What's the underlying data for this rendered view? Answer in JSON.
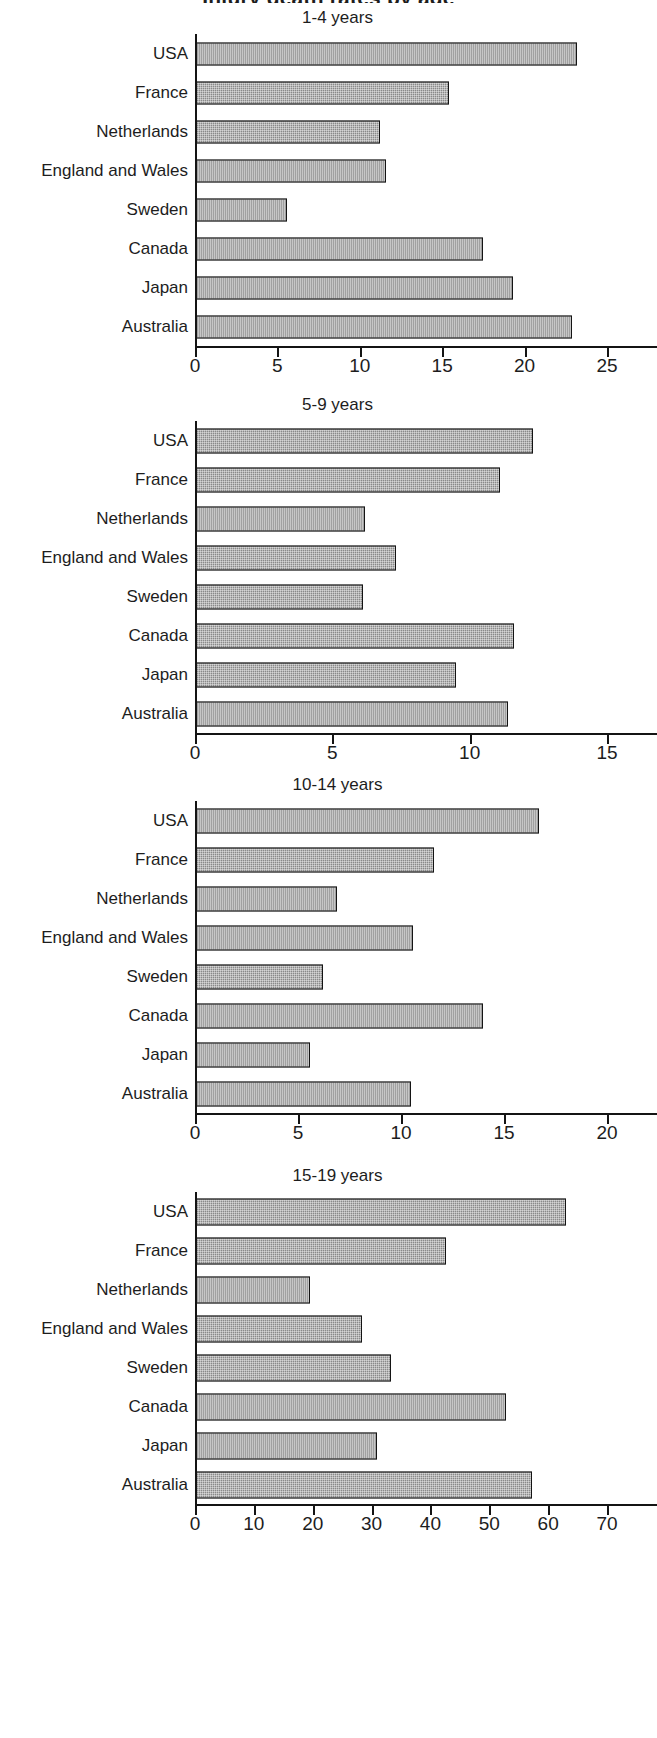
{
  "figure": {
    "main_title": "Injury death rates by age",
    "categories": [
      "USA",
      "France",
      "Netherlands",
      "England and Wales",
      "Sweden",
      "Canada",
      "Japan",
      "Australia"
    ]
  },
  "chart_data": [
    {
      "type": "bar",
      "orientation": "horizontal",
      "title": "1-4 years",
      "xlabel": "",
      "ylabel": "",
      "categories": [
        "USA",
        "France",
        "Netherlands",
        "England and Wales",
        "Sweden",
        "Canada",
        "Japan",
        "Australia"
      ],
      "values": [
        23.2,
        15.4,
        11.2,
        11.6,
        5.6,
        17.5,
        19.3,
        22.9
      ],
      "xlim": [
        0,
        25
      ],
      "ticks": [
        0,
        5,
        10,
        15,
        20,
        25
      ],
      "tick_labels": [
        "0",
        "5",
        "10",
        "15",
        "20",
        "25"
      ],
      "grid": false,
      "legend": "none"
    },
    {
      "type": "bar",
      "orientation": "horizontal",
      "title": "5-9 years",
      "xlabel": "",
      "ylabel": "",
      "categories": [
        "USA",
        "France",
        "Netherlands",
        "England and Wales",
        "Sweden",
        "Canada",
        "Japan",
        "Australia"
      ],
      "values": [
        12.3,
        11.1,
        6.2,
        7.3,
        6.1,
        11.6,
        9.5,
        11.4
      ],
      "xlim": [
        0,
        15
      ],
      "ticks": [
        0,
        5,
        10,
        15
      ],
      "tick_labels": [
        "0",
        "5",
        "10",
        "15"
      ],
      "grid": false,
      "legend": "none"
    },
    {
      "type": "bar",
      "orientation": "horizontal",
      "title": "10-14 years",
      "xlabel": "",
      "ylabel": "",
      "categories": [
        "USA",
        "France",
        "Netherlands",
        "England and Wales",
        "Sweden",
        "Canada",
        "Japan",
        "Australia"
      ],
      "values": [
        16.7,
        11.6,
        6.9,
        10.6,
        6.2,
        14.0,
        5.6,
        10.5
      ],
      "xlim": [
        0,
        20
      ],
      "ticks": [
        0,
        5,
        10,
        15,
        20
      ],
      "tick_labels": [
        "0",
        "5",
        "10",
        "15",
        "20"
      ],
      "grid": false,
      "legend": "none"
    },
    {
      "type": "bar",
      "orientation": "horizontal",
      "title": "15-19 years",
      "xlabel": "",
      "ylabel": "",
      "categories": [
        "USA",
        "France",
        "Netherlands",
        "England and Wales",
        "Sweden",
        "Canada",
        "Japan",
        "Australia"
      ],
      "values": [
        63.0,
        42.6,
        19.6,
        28.3,
        33.3,
        52.9,
        31.0,
        57.2
      ],
      "xlim": [
        0,
        70
      ],
      "ticks": [
        0,
        10,
        20,
        30,
        40,
        50,
        60,
        70
      ],
      "tick_labels": [
        "0",
        "10",
        "20",
        "30",
        "40",
        "50",
        "60",
        "70"
      ],
      "grid": false,
      "legend": "none"
    }
  ],
  "style": {
    "bar_fill": "#8a8a8a",
    "bar_edge": "#141414",
    "axis_color": "#141414",
    "text_color": "#1d1d1d",
    "background": "#ffffff"
  }
}
